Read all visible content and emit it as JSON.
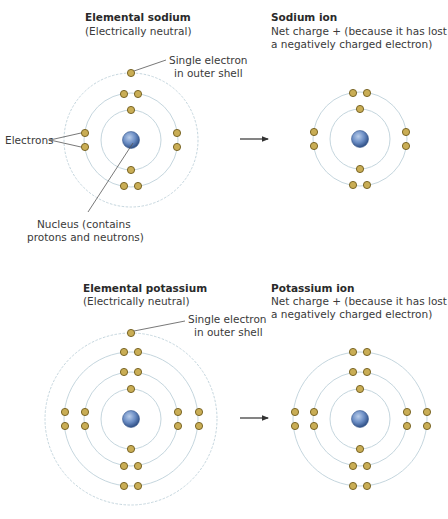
{
  "colors": {
    "electron_fill": "#c9ad55",
    "electron_stroke": "#7a6420",
    "nucleus": "#5b7fb8",
    "orbit": "#c5d6de",
    "orbit_dashed": "#c5d6de",
    "leader_line": "#555555",
    "arrow": "#333333"
  },
  "sodium_atom": {
    "title": "Elemental sodium",
    "subtitle": "(Electrically neutral)",
    "shells": [
      2,
      8,
      1
    ],
    "callout_outer_1": "Single electron",
    "callout_outer_2": "in outer shell",
    "callout_electrons": "Electrons",
    "callout_nucleus_1": "Nucleus (contains",
    "callout_nucleus_2": "protons and neutrons)"
  },
  "sodium_ion": {
    "title": "Sodium ion",
    "line1": "Net charge + (because it has lost",
    "line2": "a negatively charged electron)",
    "shells": [
      2,
      8
    ]
  },
  "potassium_atom": {
    "title": "Elemental potassium",
    "subtitle": "(Electrically neutral)",
    "shells": [
      2,
      8,
      8,
      1
    ],
    "callout_outer_1": "Single electron",
    "callout_outer_2": "in outer shell"
  },
  "potassium_ion": {
    "title": "Potassium ion",
    "line1": "Net charge + (because it has lost",
    "line2": "a negatively charged electron)",
    "shells": [
      2,
      8,
      8
    ]
  }
}
